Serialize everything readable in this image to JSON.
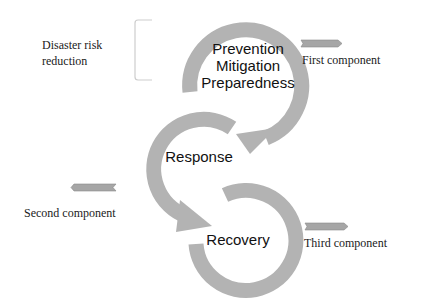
{
  "colors": {
    "arrow_fill": "#b3b3b3",
    "small_arrow_fill": "#a6a6a6",
    "bracket_stroke": "#c8c8c8",
    "text": "#111111"
  },
  "side_labels": {
    "drr": [
      "Disaster risk",
      "reduction"
    ],
    "first": "First component",
    "second": "Second component",
    "third": "Third component"
  },
  "cycle": {
    "top": [
      "Prevention",
      "Mitigation",
      "Preparedness"
    ],
    "middle": "Response",
    "bottom": "Recovery"
  }
}
